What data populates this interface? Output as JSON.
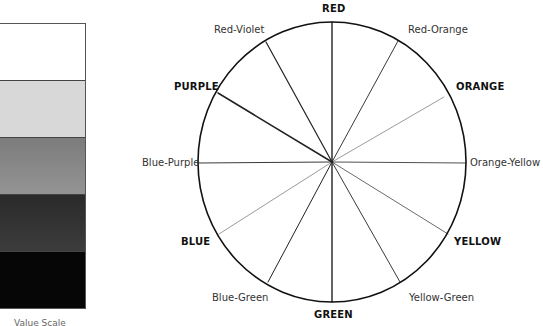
{
  "value_scale": {
    "bands": [
      {
        "name": "white",
        "color": "#ffffff"
      },
      {
        "name": "light-gray",
        "color": "#d8d8d8"
      },
      {
        "name": "medium-gray",
        "color": "#8a8a8a"
      },
      {
        "name": "dark-gray",
        "color": "#333333"
      },
      {
        "name": "black",
        "color": "#060606"
      }
    ],
    "caption": "Value Scale"
  },
  "color_wheel": {
    "center": [
      332,
      162
    ],
    "radius": [
      134,
      140
    ],
    "outline_color": "#111111",
    "labels": {
      "red": "RED",
      "red_orange": "Red-Orange",
      "orange": "ORANGE",
      "orange_yellow": "Orange-Yellow",
      "yellow": "YELLOW",
      "yellow_green": "Yellow-Green",
      "green": "GREEN",
      "blue_green": "Blue-Green",
      "blue": "BLUE",
      "blue_purple": "Blue-Purple",
      "purple": "PURPLE",
      "red_violet": "Red-Violet"
    },
    "spokes": [
      {
        "name": "red",
        "end": [
          332,
          22
        ],
        "weight": 1.4
      },
      {
        "name": "red-orange",
        "end": [
          398,
          41
        ],
        "weight": 0.9
      },
      {
        "name": "orange",
        "end": [
          444,
          97
        ],
        "weight": 0.6
      },
      {
        "name": "orange-yellow",
        "end": [
          466,
          163
        ],
        "weight": 0.8
      },
      {
        "name": "yellow",
        "end": [
          448,
          234
        ],
        "weight": 0.8
      },
      {
        "name": "yellow-green",
        "end": [
          400,
          282
        ],
        "weight": 0.9
      },
      {
        "name": "green",
        "end": [
          332,
          302
        ],
        "weight": 1.4
      },
      {
        "name": "blue-green",
        "end": [
          268,
          282
        ],
        "weight": 1.0
      },
      {
        "name": "blue",
        "end": [
          219,
          234
        ],
        "weight": 0.6
      },
      {
        "name": "blue-purple",
        "end": [
          198,
          163
        ],
        "weight": 0.9
      },
      {
        "name": "purple",
        "end": [
          218,
          93
        ],
        "weight": 1.5
      },
      {
        "name": "red-violet",
        "end": [
          266,
          42
        ],
        "weight": 1.2
      }
    ]
  }
}
